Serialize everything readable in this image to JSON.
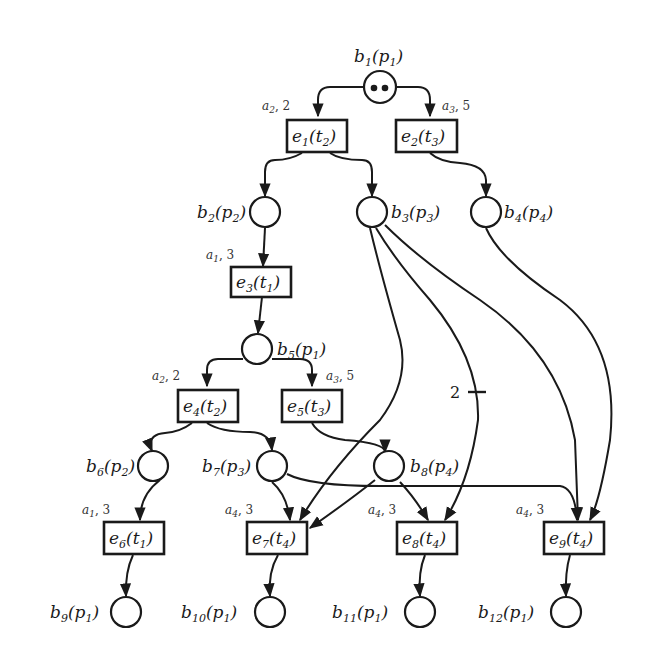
{
  "diagram": {
    "type": "petri-net-unfolding",
    "places": [
      {
        "id": "b1",
        "name": "b",
        "sub": "1",
        "place": "p",
        "psub": "1",
        "tokens": 2
      },
      {
        "id": "b2",
        "name": "b",
        "sub": "2",
        "place": "p",
        "psub": "2",
        "tokens": 0
      },
      {
        "id": "b3",
        "name": "b",
        "sub": "3",
        "place": "p",
        "psub": "3",
        "tokens": 0
      },
      {
        "id": "b4",
        "name": "b",
        "sub": "4",
        "place": "p",
        "psub": "4",
        "tokens": 0
      },
      {
        "id": "b5",
        "name": "b",
        "sub": "5",
        "place": "p",
        "psub": "1",
        "tokens": 0
      },
      {
        "id": "b6",
        "name": "b",
        "sub": "6",
        "place": "p",
        "psub": "2",
        "tokens": 0
      },
      {
        "id": "b7",
        "name": "b",
        "sub": "7",
        "place": "p",
        "psub": "3",
        "tokens": 0
      },
      {
        "id": "b8",
        "name": "b",
        "sub": "8",
        "place": "p",
        "psub": "4",
        "tokens": 0
      },
      {
        "id": "b9",
        "name": "b",
        "sub": "9",
        "place": "p",
        "psub": "1",
        "tokens": 0
      },
      {
        "id": "b10",
        "name": "b",
        "sub": "10",
        "place": "p",
        "psub": "1",
        "tokens": 0
      },
      {
        "id": "b11",
        "name": "b",
        "sub": "11",
        "place": "p",
        "psub": "1",
        "tokens": 0
      },
      {
        "id": "b12",
        "name": "b",
        "sub": "12",
        "place": "p",
        "psub": "1",
        "tokens": 0
      }
    ],
    "events": [
      {
        "id": "e1",
        "name": "e",
        "sub": "1",
        "trans": "t",
        "tsub": "2",
        "action": "a",
        "asub": "2",
        "time": "2"
      },
      {
        "id": "e2",
        "name": "e",
        "sub": "2",
        "trans": "t",
        "tsub": "3",
        "action": "a",
        "asub": "3",
        "time": "5"
      },
      {
        "id": "e3",
        "name": "e",
        "sub": "3",
        "trans": "t",
        "tsub": "1",
        "action": "a",
        "asub": "1",
        "time": "3"
      },
      {
        "id": "e4",
        "name": "e",
        "sub": "4",
        "trans": "t",
        "tsub": "2",
        "action": "a",
        "asub": "2",
        "time": "2"
      },
      {
        "id": "e5",
        "name": "e",
        "sub": "5",
        "trans": "t",
        "tsub": "3",
        "action": "a",
        "asub": "3",
        "time": "5"
      },
      {
        "id": "e6",
        "name": "e",
        "sub": "6",
        "trans": "t",
        "tsub": "1",
        "action": "a",
        "asub": "1",
        "time": "3"
      },
      {
        "id": "e7",
        "name": "e",
        "sub": "7",
        "trans": "t",
        "tsub": "4",
        "action": "a",
        "asub": "4",
        "time": "3"
      },
      {
        "id": "e8",
        "name": "e",
        "sub": "8",
        "trans": "t",
        "tsub": "4",
        "action": "a",
        "asub": "4",
        "time": "3"
      },
      {
        "id": "e9",
        "name": "e",
        "sub": "9",
        "trans": "t",
        "tsub": "4",
        "action": "a",
        "asub": "4",
        "time": "3"
      }
    ],
    "arcs": [
      {
        "from": "b1",
        "to": "e1"
      },
      {
        "from": "b1",
        "to": "e2"
      },
      {
        "from": "e1",
        "to": "b2"
      },
      {
        "from": "e1",
        "to": "b3"
      },
      {
        "from": "e2",
        "to": "b4"
      },
      {
        "from": "b2",
        "to": "e3"
      },
      {
        "from": "e3",
        "to": "b5"
      },
      {
        "from": "b5",
        "to": "e4"
      },
      {
        "from": "b5",
        "to": "e5"
      },
      {
        "from": "e4",
        "to": "b6"
      },
      {
        "from": "e4",
        "to": "b7"
      },
      {
        "from": "e5",
        "to": "b8"
      },
      {
        "from": "b6",
        "to": "e6"
      },
      {
        "from": "b7",
        "to": "e7"
      },
      {
        "from": "b7",
        "to": "e9"
      },
      {
        "from": "b8",
        "to": "e7"
      },
      {
        "from": "b8",
        "to": "e8"
      },
      {
        "from": "b3",
        "to": "e7"
      },
      {
        "from": "b3",
        "to": "e8",
        "weight": "2"
      },
      {
        "from": "b3",
        "to": "e9"
      },
      {
        "from": "b4",
        "to": "e9"
      },
      {
        "from": "e6",
        "to": "b9"
      },
      {
        "from": "e7",
        "to": "b10"
      },
      {
        "from": "e8",
        "to": "b11"
      },
      {
        "from": "e9",
        "to": "b12"
      }
    ],
    "weight_label": "2"
  }
}
